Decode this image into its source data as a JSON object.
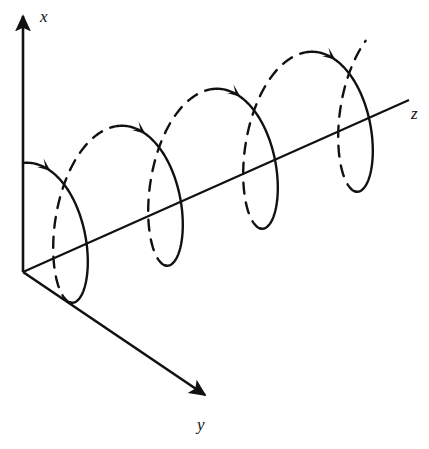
{
  "figure": {
    "name": "circular-helix-3d-diagram",
    "background_color": "#ffffff",
    "stroke_color": "#111111",
    "width": 429,
    "height": 449
  },
  "axes": {
    "origin": {
      "x": 23,
      "y": 272
    },
    "items": [
      {
        "id": "x",
        "label": "x",
        "label_pos": {
          "x": 40,
          "y": 22
        },
        "tip": {
          "x": 23,
          "y": 14
        },
        "arrow": true
      },
      {
        "id": "y",
        "label": "y",
        "label_pos": {
          "x": 197,
          "y": 430
        },
        "tip": {
          "x": 208,
          "y": 398
        },
        "arrow": true
      },
      {
        "id": "z",
        "label": "z",
        "label_pos": {
          "x": 411,
          "y": 119
        },
        "tip": {
          "x": 409,
          "y": 100
        },
        "arrow": false
      }
    ]
  },
  "chart_data": {
    "type": "line",
    "title": "",
    "xlabel": "z",
    "ylabel": "x",
    "axis_directions": {
      "x": "up",
      "y": "down-right (toward viewer)",
      "z": "up-right (into page)"
    },
    "helix": {
      "turns": 4,
      "start_point_on_x_axis": {
        "x": 23,
        "y": 163
      },
      "radius_vertical_px": 79,
      "radius_horizontal_px": 38,
      "period_dz_px": 95,
      "period_dy_px": -37,
      "handedness": "right-handed",
      "coil_centers": [
        {
          "x": 98,
          "y": 243
        },
        {
          "x": 193,
          "y": 206
        },
        {
          "x": 288,
          "y": 169
        },
        {
          "x": 383,
          "y": 132
        }
      ],
      "direction_arrow_points": [
        {
          "x": 60,
          "y": 158
        },
        {
          "x": 176,
          "y": 110
        },
        {
          "x": 261,
          "y": 66
        },
        {
          "x": 356,
          "y": 32
        }
      ]
    },
    "legend": {
      "position": "none",
      "entries": [
        {
          "label": "solid arc",
          "meaning": "front half of turn (visible)"
        },
        {
          "label": "dashed arc",
          "meaning": "back half of turn (hidden)"
        }
      ]
    },
    "grid": false
  }
}
